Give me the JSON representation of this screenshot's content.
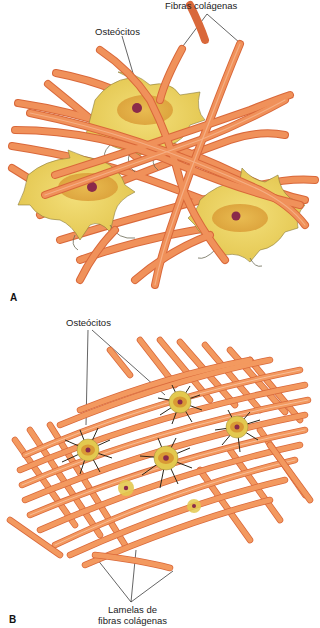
{
  "panels": [
    {
      "letter": "A",
      "labels": {
        "fibers": "Fibras colágenas",
        "osteocytes": "Osteócitos"
      }
    },
    {
      "letter": "B",
      "labels": {
        "osteocytes": "Osteócitos",
        "lamellae_line1": "Lamelas de",
        "lamellae_line2": "fibras colágenas"
      }
    }
  ],
  "colors": {
    "fiber": "#f0915a",
    "fiber_edge": "#d9683a",
    "fiber_highlight": "#f7b68e",
    "cell_body": "#e8d25a",
    "cell_inner": "#d9a23a",
    "nucleus": "#8b2a4a",
    "process_dark": "#2a2418",
    "leader_line": "#222222"
  }
}
